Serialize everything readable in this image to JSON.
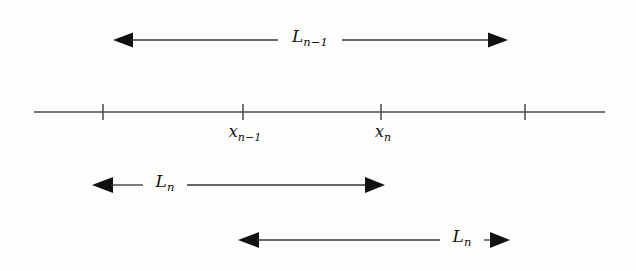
{
  "figure": {
    "type": "number-line-interval-diagram",
    "background_color": "#fdfdfb",
    "ink_color": "#111111",
    "line_color": "#4a4a4a",
    "width": 636,
    "height": 271,
    "axis": {
      "name": "number-line",
      "y": 112,
      "x_start": 34,
      "x_end": 605,
      "ticks": [
        {
          "x": 103,
          "label": ""
        },
        {
          "x": 243,
          "label": "x_{n-1}"
        },
        {
          "x": 381,
          "label": "x_n"
        },
        {
          "x": 525,
          "label": ""
        }
      ]
    },
    "tick_labels": [
      {
        "name": "tick-label-x-n-minus-1",
        "base": "x",
        "sub": "n−1",
        "x": 245,
        "y": 124
      },
      {
        "name": "tick-label-x-n",
        "base": "x",
        "sub": "n",
        "x": 383,
        "y": 124
      }
    ],
    "measure_arrows": [
      {
        "name": "length-arrow-l-n-minus-1",
        "y": 40,
        "x_from": 113,
        "x_to": 508,
        "label_base": "L",
        "label_sub": "n−1",
        "label_x": 310,
        "label_y": 28,
        "label_gap": 64,
        "arrowheads": "both"
      },
      {
        "name": "length-arrow-l-n-left",
        "y": 185,
        "x_from": 92,
        "x_to": 385,
        "label_base": "L",
        "label_sub": "n",
        "label_x": 165,
        "label_y": 173,
        "label_gap": 44,
        "arrowheads": "both"
      },
      {
        "name": "length-arrow-l-n-right",
        "y": 240,
        "x_from": 238,
        "x_to": 510,
        "label_base": "L",
        "label_sub": "n",
        "label_x": 462,
        "label_y": 228,
        "label_gap": 44,
        "arrowheads": "both"
      }
    ],
    "caption": ""
  }
}
